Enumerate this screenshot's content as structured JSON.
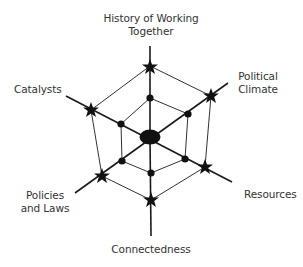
{
  "diagram": {
    "type": "hexagonal radial (spider/web) diagram",
    "center": {
      "label": "",
      "shape": "filled ellipse"
    },
    "axes": [
      {
        "id": "history",
        "label_line1": "History of Working",
        "label_line2": "Together",
        "outer_marker": "star",
        "inner_marker": "dot"
      },
      {
        "id": "political",
        "label_line1": "Political",
        "label_line2": "Climate",
        "outer_marker": "star",
        "inner_marker": "dot"
      },
      {
        "id": "resources",
        "label_line1": "Resources",
        "label_line2": "",
        "outer_marker": "star",
        "inner_marker": "dot"
      },
      {
        "id": "connectedness",
        "label_line1": "Connectedness",
        "label_line2": "",
        "outer_marker": "star",
        "inner_marker": "dot"
      },
      {
        "id": "policies",
        "label_line1": "Policies",
        "label_line2": "and Laws",
        "outer_marker": "star",
        "inner_marker": "dot"
      },
      {
        "id": "catalysts",
        "label_line1": "Catalysts",
        "label_line2": "",
        "outer_marker": "star",
        "inner_marker": "dot"
      }
    ],
    "rings": [
      {
        "name": "inner",
        "marker": "dot"
      },
      {
        "name": "outer",
        "marker": "star"
      }
    ],
    "colors": {
      "line": "#1a1a1a",
      "fill": "#111111",
      "text": "#333333",
      "background": "#ffffff"
    }
  }
}
